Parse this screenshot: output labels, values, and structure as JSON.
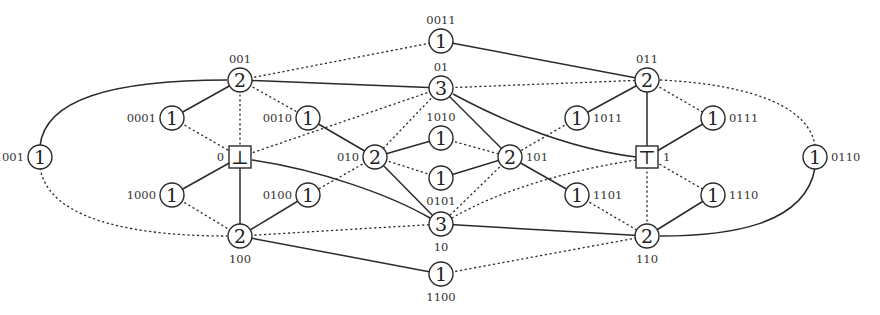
{
  "diagram": {
    "type": "lattice-graph",
    "nodes": [
      {
        "id": "0011",
        "label": "0011",
        "value": "1",
        "shape": "circle",
        "x": 441,
        "y": 41,
        "label_pos": "above"
      },
      {
        "id": "001",
        "label": "001",
        "value": "2",
        "shape": "circle",
        "x": 240,
        "y": 80,
        "label_pos": "above"
      },
      {
        "id": "01",
        "label": "01",
        "value": "3",
        "shape": "circle",
        "x": 441,
        "y": 88,
        "label_pos": "above"
      },
      {
        "id": "011",
        "label": "011",
        "value": "2",
        "shape": "circle",
        "x": 647,
        "y": 80,
        "label_pos": "above"
      },
      {
        "id": "0001",
        "label": "0001",
        "value": "1",
        "shape": "circle",
        "x": 172,
        "y": 118,
        "label_pos": "left"
      },
      {
        "id": "0010",
        "label": "0010",
        "value": "1",
        "shape": "circle",
        "x": 308,
        "y": 118,
        "label_pos": "left"
      },
      {
        "id": "1010",
        "label": "1010",
        "value": "1",
        "shape": "circle",
        "x": 441,
        "y": 138,
        "label_pos": "above"
      },
      {
        "id": "1011",
        "label": "1011",
        "value": "1",
        "shape": "circle",
        "x": 577,
        "y": 118,
        "label_pos": "right"
      },
      {
        "id": "0111",
        "label": "0111",
        "value": "1",
        "shape": "circle",
        "x": 713,
        "y": 118,
        "label_pos": "right"
      },
      {
        "id": "1001",
        "label": "1001",
        "value": "1",
        "shape": "circle",
        "x": 40,
        "y": 157,
        "label_pos": "left"
      },
      {
        "id": "0",
        "label": "0",
        "value": "⊥",
        "shape": "box",
        "x": 240,
        "y": 157,
        "label_pos": "left"
      },
      {
        "id": "010",
        "label": "010",
        "value": "2",
        "shape": "circle",
        "x": 375,
        "y": 157,
        "label_pos": "left"
      },
      {
        "id": "101",
        "label": "101",
        "value": "2",
        "shape": "circle",
        "x": 510,
        "y": 157,
        "label_pos": "right"
      },
      {
        "id": "1",
        "label": "1",
        "value": "⊤",
        "shape": "box",
        "x": 647,
        "y": 157,
        "label_pos": "right"
      },
      {
        "id": "0110",
        "label": "0110",
        "value": "1",
        "shape": "circle",
        "x": 815,
        "y": 157,
        "label_pos": "right"
      },
      {
        "id": "0101",
        "label": "0101",
        "value": "1",
        "shape": "circle",
        "x": 441,
        "y": 178,
        "label_pos": "below"
      },
      {
        "id": "1000",
        "label": "1000",
        "value": "1",
        "shape": "circle",
        "x": 172,
        "y": 195,
        "label_pos": "left"
      },
      {
        "id": "0100",
        "label": "0100",
        "value": "1",
        "shape": "circle",
        "x": 308,
        "y": 195,
        "label_pos": "left"
      },
      {
        "id": "1101",
        "label": "1101",
        "value": "1",
        "shape": "circle",
        "x": 577,
        "y": 195,
        "label_pos": "right"
      },
      {
        "id": "1110",
        "label": "1110",
        "value": "1",
        "shape": "circle",
        "x": 713,
        "y": 195,
        "label_pos": "right"
      },
      {
        "id": "10",
        "label": "10",
        "value": "3",
        "shape": "circle",
        "x": 441,
        "y": 224,
        "label_pos": "below"
      },
      {
        "id": "100",
        "label": "100",
        "value": "2",
        "shape": "circle",
        "x": 240,
        "y": 236,
        "label_pos": "below"
      },
      {
        "id": "110",
        "label": "110",
        "value": "2",
        "shape": "circle",
        "x": 647,
        "y": 236,
        "label_pos": "below"
      },
      {
        "id": "1100",
        "label": "1100",
        "value": "1",
        "shape": "circle",
        "x": 441,
        "y": 274,
        "label_pos": "below"
      }
    ],
    "edges": [
      {
        "from": "0011",
        "to": "011",
        "style": "solid"
      },
      {
        "from": "001",
        "to": "0011",
        "style": "dotted"
      },
      {
        "from": "001",
        "to": "01",
        "style": "solid"
      },
      {
        "from": "001",
        "to": "0001",
        "style": "solid"
      },
      {
        "from": "001",
        "to": "0010",
        "style": "dotted"
      },
      {
        "from": "001",
        "to": "0",
        "style": "dotted"
      },
      {
        "from": "001",
        "to": "1001",
        "style": "solid",
        "curve": "M 227 80 C 110 80, 45 100, 40 146"
      },
      {
        "from": "01",
        "to": "011",
        "style": "dotted"
      },
      {
        "from": "01",
        "to": "0",
        "style": "dotted"
      },
      {
        "from": "01",
        "to": "010",
        "style": "dotted"
      },
      {
        "from": "01",
        "to": "101",
        "style": "solid"
      },
      {
        "from": "01",
        "to": "1",
        "style": "solid",
        "curve": "M 453 94 C 520 130, 580 150, 636 157"
      },
      {
        "from": "011",
        "to": "1011",
        "style": "solid"
      },
      {
        "from": "011",
        "to": "0111",
        "style": "dotted"
      },
      {
        "from": "011",
        "to": "1",
        "style": "solid"
      },
      {
        "from": "011",
        "to": "0110",
        "style": "dotted",
        "curve": "M 660 80 C 760 85, 810 110, 815 146"
      },
      {
        "from": "0001",
        "to": "0",
        "style": "dotted"
      },
      {
        "from": "0010",
        "to": "010",
        "style": "solid"
      },
      {
        "from": "1010",
        "to": "010",
        "style": "solid"
      },
      {
        "from": "1010",
        "to": "101",
        "style": "dotted"
      },
      {
        "from": "1011",
        "to": "101",
        "style": "dotted"
      },
      {
        "from": "0111",
        "to": "1",
        "style": "solid"
      },
      {
        "from": "1001",
        "to": "100",
        "style": "dotted",
        "curve": "M 40 168 C 50 225, 150 236, 227 236"
      },
      {
        "from": "0",
        "to": "1000",
        "style": "solid"
      },
      {
        "from": "0",
        "to": "100",
        "style": "solid"
      },
      {
        "from": "0",
        "to": "10",
        "style": "solid",
        "curve": "M 252 160 C 320 170, 390 195, 430 218"
      },
      {
        "from": "010",
        "to": "0101",
        "style": "dotted"
      },
      {
        "from": "010",
        "to": "0100",
        "style": "dotted"
      },
      {
        "from": "010",
        "to": "10",
        "style": "solid"
      },
      {
        "from": "101",
        "to": "0101",
        "style": "solid"
      },
      {
        "from": "101",
        "to": "10",
        "style": "dotted"
      },
      {
        "from": "101",
        "to": "1101",
        "style": "solid"
      },
      {
        "from": "1",
        "to": "10",
        "style": "dotted",
        "curve": "M 636 160 C 570 170, 500 190, 452 218"
      },
      {
        "from": "1",
        "to": "110",
        "style": "dotted"
      },
      {
        "from": "1",
        "to": "1110",
        "style": "dotted"
      },
      {
        "from": "0110",
        "to": "110",
        "style": "solid",
        "curve": "M 815 168 C 805 225, 730 236, 660 236"
      },
      {
        "from": "1000",
        "to": "100",
        "style": "dotted"
      },
      {
        "from": "0100",
        "to": "100",
        "style": "solid"
      },
      {
        "from": "1101",
        "to": "110",
        "style": "dotted"
      },
      {
        "from": "1110",
        "to": "110",
        "style": "solid"
      },
      {
        "from": "100",
        "to": "10",
        "style": "dotted"
      },
      {
        "from": "100",
        "to": "1100",
        "style": "solid"
      },
      {
        "from": "10",
        "to": "110",
        "style": "solid"
      },
      {
        "from": "1100",
        "to": "110",
        "style": "dotted"
      }
    ]
  }
}
